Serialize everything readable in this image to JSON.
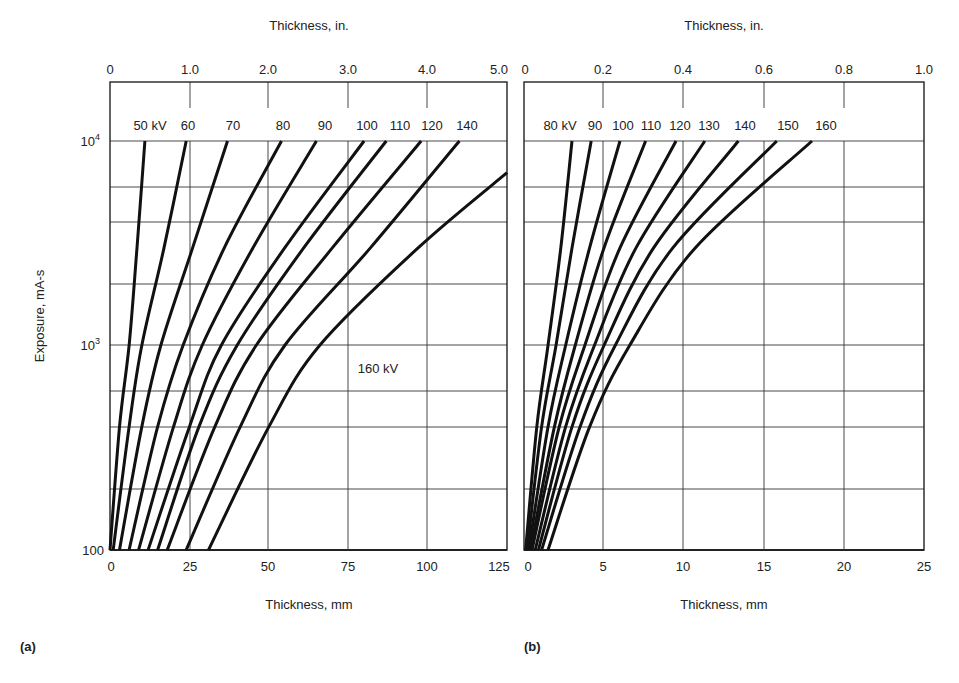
{
  "figure": {
    "panels": [
      {
        "id": "a",
        "label": "(a)"
      },
      {
        "id": "b",
        "label": "(b)"
      }
    ]
  },
  "chart_data": [
    {
      "type": "line",
      "panel": "(a)",
      "title": "",
      "xlabel": "Thickness, mm",
      "x2label": "Thickness, in.",
      "ylabel": "Exposure, mA-s",
      "xlim": [
        0,
        125
      ],
      "x2lim": [
        0,
        5.0
      ],
      "ylim": [
        100,
        20000
      ],
      "yscale": "log",
      "grid": true,
      "xticks": [
        "0",
        "25",
        "50",
        "75",
        "100",
        "125"
      ],
      "x2ticks": [
        "0",
        "1.0",
        "2.0",
        "3.0",
        "4.0",
        "5.0"
      ],
      "yticks": [
        "100",
        "10^3",
        "10^4"
      ],
      "series": [
        {
          "name": "50 kV",
          "label": "50 kV",
          "points": [
            [
              0,
              100
            ],
            [
              3,
              400
            ],
            [
              6,
              1000
            ],
            [
              8.5,
              3000
            ],
            [
              11,
              10000
            ]
          ]
        },
        {
          "name": "60 kV",
          "label": "60",
          "points": [
            [
              1,
              100
            ],
            [
              6,
              400
            ],
            [
              10,
              1000
            ],
            [
              17,
              3000
            ],
            [
              24,
              10000
            ]
          ]
        },
        {
          "name": "70 kV",
          "label": "70",
          "points": [
            [
              3,
              100
            ],
            [
              10,
              400
            ],
            [
              16,
              1000
            ],
            [
              26,
              3000
            ],
            [
              37,
              10000
            ]
          ]
        },
        {
          "name": "80 kV",
          "label": "80",
          "points": [
            [
              6,
              100
            ],
            [
              15,
              400
            ],
            [
              23,
              1000
            ],
            [
              36,
              3000
            ],
            [
              54,
              10000
            ]
          ]
        },
        {
          "name": "90 kV",
          "label": "90",
          "points": [
            [
              9,
              100
            ],
            [
              20,
              400
            ],
            [
              29,
              1000
            ],
            [
              45,
              3000
            ],
            [
              65,
              10000
            ]
          ]
        },
        {
          "name": "100 kV",
          "label": "100",
          "points": [
            [
              12,
              100
            ],
            [
              25,
              400
            ],
            [
              35,
              1000
            ],
            [
              55,
              3000
            ],
            [
              80,
              10000
            ]
          ]
        },
        {
          "name": "110 kV",
          "label": "110",
          "points": [
            [
              15,
              100
            ],
            [
              28,
              400
            ],
            [
              40,
              1000
            ],
            [
              61,
              3000
            ],
            [
              87,
              10000
            ]
          ]
        },
        {
          "name": "120 kV",
          "label": "120",
          "points": [
            [
              18,
              100
            ],
            [
              33,
              400
            ],
            [
              46,
              1000
            ],
            [
              70,
              3000
            ],
            [
              98,
              10000
            ]
          ]
        },
        {
          "name": "140 kV",
          "label": "140",
          "points": [
            [
              24,
              100
            ],
            [
              41,
              400
            ],
            [
              55,
              1000
            ],
            [
              82,
              3000
            ],
            [
              110,
              10000
            ]
          ]
        },
        {
          "name": "160 kV",
          "label": "160 kV",
          "points": [
            [
              31,
              100
            ],
            [
              50,
              400
            ],
            [
              66,
              1000
            ],
            [
              97,
              3000
            ],
            [
              125,
              7000
            ]
          ]
        }
      ]
    },
    {
      "type": "line",
      "panel": "(b)",
      "title": "",
      "xlabel": "Thickness, mm",
      "x2label": "Thickness, in.",
      "ylabel": "Exposure, mA-s",
      "xlim": [
        0,
        25
      ],
      "x2lim": [
        0,
        1.0
      ],
      "ylim": [
        100,
        20000
      ],
      "yscale": "log",
      "grid": true,
      "xticks": [
        "0",
        "5",
        "10",
        "15",
        "20",
        "25"
      ],
      "x2ticks": [
        "0",
        "0.2",
        "0.4",
        "0.6",
        "0.8",
        "1.0"
      ],
      "yticks": [
        "100",
        "10^3",
        "10^4"
      ],
      "series": [
        {
          "name": "80 kV",
          "label": "80 kV",
          "points": [
            [
              0.1,
              100
            ],
            [
              0.8,
              400
            ],
            [
              1.5,
              1000
            ],
            [
              2.3,
              3000
            ],
            [
              3.0,
              10000
            ]
          ]
        },
        {
          "name": "90 kV",
          "label": "90",
          "points": [
            [
              0.2,
              100
            ],
            [
              1.1,
              400
            ],
            [
              2.0,
              1000
            ],
            [
              3.0,
              3000
            ],
            [
              4.2,
              10000
            ]
          ]
        },
        {
          "name": "100 kV",
          "label": "100",
          "points": [
            [
              0.3,
              100
            ],
            [
              1.5,
              400
            ],
            [
              2.6,
              1000
            ],
            [
              4.1,
              3000
            ],
            [
              6.0,
              10000
            ]
          ]
        },
        {
          "name": "110 kV",
          "label": "110",
          "points": [
            [
              0.4,
              100
            ],
            [
              1.9,
              400
            ],
            [
              3.2,
              1000
            ],
            [
              5.0,
              3000
            ],
            [
              7.6,
              10000
            ]
          ]
        },
        {
          "name": "120 kV",
          "label": "120",
          "points": [
            [
              0.5,
              100
            ],
            [
              2.2,
              400
            ],
            [
              3.8,
              1000
            ],
            [
              6.0,
              3000
            ],
            [
              9.5,
              10000
            ]
          ]
        },
        {
          "name": "130 kV",
          "label": "130",
          "points": [
            [
              0.7,
              100
            ],
            [
              2.6,
              400
            ],
            [
              4.4,
              1000
            ],
            [
              7.0,
              3000
            ],
            [
              11.3,
              10000
            ]
          ]
        },
        {
          "name": "140 kV",
          "label": "140",
          "points": [
            [
              0.9,
              100
            ],
            [
              3.0,
              400
            ],
            [
              5.0,
              1000
            ],
            [
              8.1,
              3000
            ],
            [
              13.4,
              10000
            ]
          ]
        },
        {
          "name": "150 kV",
          "label": "150",
          "points": [
            [
              1.1,
              100
            ],
            [
              3.5,
              400
            ],
            [
              5.7,
              1000
            ],
            [
              9.3,
              3000
            ],
            [
              15.8,
              10000
            ]
          ]
        },
        {
          "name": "160 kV",
          "label": "160",
          "points": [
            [
              1.5,
              100
            ],
            [
              4.1,
              400
            ],
            [
              6.6,
              1000
            ],
            [
              10.7,
              3000
            ],
            [
              18.0,
              10000
            ]
          ]
        }
      ]
    }
  ],
  "caption": {
    "text": ""
  }
}
